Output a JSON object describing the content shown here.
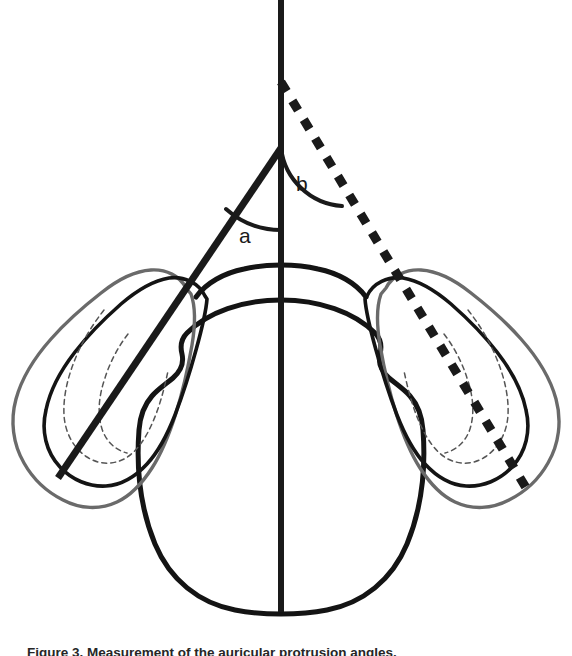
{
  "figure": {
    "kind": "anatomical-line-diagram",
    "view": "axial / superior view of head with both auricles",
    "background_color": "#ffffff",
    "width": 572,
    "height": 656
  },
  "labels": {
    "angle_a": "a",
    "angle_b": "b"
  },
  "caption": {
    "text": "Figure 3.   Measurement of the auricular protrusion angles.",
    "clipped": true
  },
  "colors": {
    "ink_black": "#1a1a1a",
    "contour_black": "#141414",
    "contour_gray": "#6a6a6a",
    "inner_dashed_gray": "#555555"
  },
  "geometry": {
    "midline": {
      "name": "vertical-midline",
      "x": 281,
      "y_top": 0,
      "y_bottom": 612,
      "stroke_width": 6,
      "style": "solid"
    },
    "angle_a_line": {
      "name": "solid-oblique-line",
      "vertex": [
        281,
        148
      ],
      "end": [
        58,
        478
      ],
      "stroke_width": 7,
      "style": "solid"
    },
    "angle_b_line": {
      "name": "dashed-oblique-line",
      "vertex": [
        281,
        82
      ],
      "end": [
        531,
        496
      ],
      "stroke_width": 9,
      "style": "square-dashed"
    },
    "arc_a": {
      "vertex": [
        281,
        148
      ],
      "radius": 82,
      "stroke_width": 4
    },
    "arc_b": {
      "vertex": [
        281,
        82
      ],
      "radius": 66,
      "stroke_width": 4
    }
  },
  "structures": [
    {
      "name": "head-outline",
      "side": "midline",
      "stroke": "#141414"
    },
    {
      "name": "nose-arc",
      "side": "midline",
      "stroke": "#141414"
    },
    {
      "name": "left-ear-outer-contour",
      "side": "left",
      "stroke": "#6a6a6a"
    },
    {
      "name": "left-ear-middle-contour",
      "side": "left",
      "stroke": "#141414"
    },
    {
      "name": "left-ear-inner-contour",
      "side": "left",
      "stroke": "#555555",
      "style": "dashed"
    },
    {
      "name": "right-ear-outer-contour",
      "side": "right",
      "stroke": "#6a6a6a"
    },
    {
      "name": "right-ear-middle-contour",
      "side": "right",
      "stroke": "#141414"
    },
    {
      "name": "right-ear-inner-contour",
      "side": "right",
      "stroke": "#555555",
      "style": "dashed"
    }
  ]
}
